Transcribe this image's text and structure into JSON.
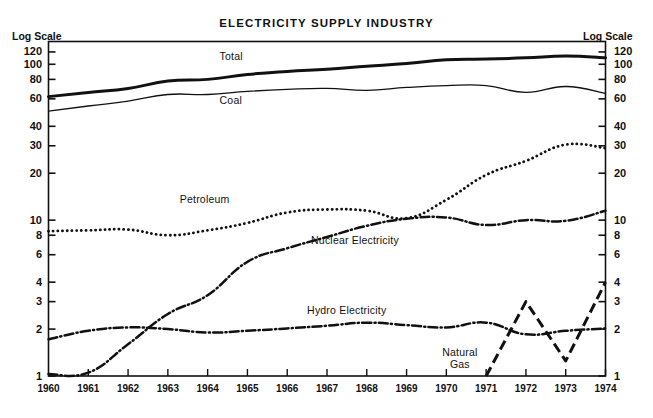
{
  "chart": {
    "title": "ELECTRICITY SUPPLY INDUSTRY",
    "left_scale_label": "Log Scale",
    "right_scale_label": "Log Scale"
  },
  "chart_data": {
    "type": "line",
    "title": "ELECTRICITY SUPPLY INDUSTRY",
    "xlabel": "",
    "ylabel": "Log Scale",
    "y_scale": "log",
    "ylim": [
      1,
      140
    ],
    "grid": false,
    "legend": "inline-annotations",
    "x": [
      1960,
      1961,
      1962,
      1963,
      1964,
      1965,
      1966,
      1967,
      1968,
      1969,
      1970,
      1971,
      1972,
      1973,
      1974
    ],
    "x_tick_labels": [
      "1960",
      "1961",
      "1962",
      "1963",
      "1964",
      "1965",
      "1966",
      "1967",
      "1968",
      "1969",
      "1970",
      "1971",
      "1972",
      "1973",
      "1974"
    ],
    "y_tick_labels": [
      "120",
      "100",
      "80",
      "60",
      "40",
      "30",
      "20",
      "10",
      "8",
      "6",
      "4",
      "3",
      "2",
      "1"
    ],
    "y_ticks": [
      120,
      100,
      80,
      60,
      40,
      30,
      20,
      10,
      8,
      6,
      4,
      3,
      2,
      1
    ],
    "series": [
      {
        "name": "Total",
        "style": "solid-thick",
        "label_x": 1964.3,
        "label_y": 112,
        "values": [
          62,
          66,
          70,
          78,
          80,
          86,
          90,
          93,
          97,
          101,
          107,
          108,
          110,
          113,
          110
        ]
      },
      {
        "name": "Coal",
        "style": "solid-thin",
        "label_x": 1964.3,
        "label_y": 58,
        "values": [
          50,
          54,
          58,
          64,
          64,
          67,
          69,
          70,
          68,
          71,
          73,
          73,
          66,
          72,
          65
        ]
      },
      {
        "name": "Petroleum",
        "style": "dotted",
        "label_x": 1963.3,
        "label_y": 13.5,
        "values": [
          8.5,
          8.6,
          8.7,
          8.0,
          8.6,
          9.6,
          11.2,
          11.7,
          11.5,
          10.3,
          13.5,
          19.5,
          24.0,
          30.5,
          29.0
        ]
      },
      {
        "name": "Nuclear Electricity",
        "style": "dash-dot",
        "label_x": 1966.6,
        "label_y": 7.4,
        "values": [
          1.03,
          1.05,
          1.6,
          2.5,
          3.3,
          5.4,
          6.6,
          7.8,
          9.2,
          10.2,
          10.4,
          9.3,
          10.0,
          9.9,
          11.5
        ]
      },
      {
        "name": "Hydro Electricity",
        "style": "dash-dot",
        "label_x": 1966.5,
        "label_y": 2.62,
        "values": [
          1.72,
          1.95,
          2.05,
          2.0,
          1.9,
          1.95,
          2.02,
          2.1,
          2.2,
          2.12,
          2.05,
          2.2,
          1.85,
          1.95,
          2.02
        ]
      },
      {
        "name": "Natural Gas",
        "style": "dashed-long",
        "label_line1": "Natural",
        "label_line2": "Gas",
        "label_x": 1970.6,
        "label_y": 1.38,
        "x": [
          1971,
          1972,
          1973,
          1974
        ],
        "values": [
          1.0,
          3.0,
          1.25,
          4.0
        ]
      }
    ]
  }
}
